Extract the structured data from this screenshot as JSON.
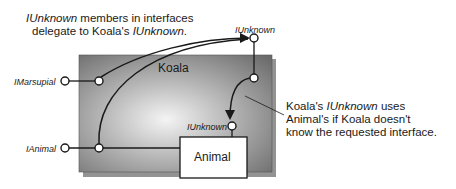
{
  "diagram": {
    "caption_top": {
      "line1_italic": "IUnknown",
      "line1_rest": " members in interfaces",
      "line2_pre": "delegate to Koala's ",
      "line2_italic": "IUnknown",
      "line2_post": "."
    },
    "caption_right": {
      "line1_pre": "Koala's ",
      "line1_italic": "IUnknown",
      "line1_post": " uses",
      "line2": "Animal's if Koala doesn't",
      "line3": "know the requested interface."
    },
    "outer_object": {
      "label": "Koala"
    },
    "inner_object": {
      "label": "Animal"
    },
    "interfaces": {
      "koala_iunknown": "IUnknown",
      "imarsupial": "IMarsupial",
      "ianimal": "IAnimal",
      "animal_iunknown": "IUnknown"
    },
    "colors": {
      "box_dark": "#6b6b6b",
      "box_light": "#f2f2f2",
      "line": "#1a1a1a",
      "inner_box": "#ffffff"
    }
  }
}
